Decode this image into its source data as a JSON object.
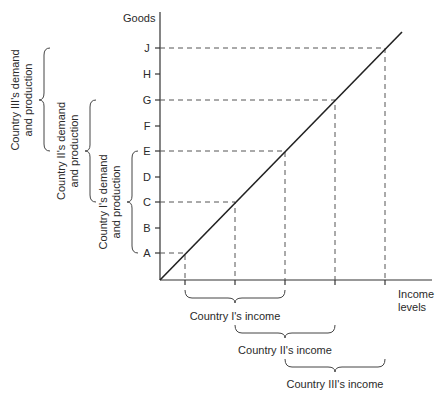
{
  "axes": {
    "y_label": "Goods",
    "x_label_line1": "Income",
    "x_label_line2": "levels"
  },
  "y_ticks": [
    "A",
    "B",
    "C",
    "D",
    "E",
    "F",
    "G",
    "H",
    "J"
  ],
  "brackets_left": {
    "country1": {
      "line1": "Country I's demand",
      "line2": "and production"
    },
    "country2": {
      "line1": "Country II's demand",
      "line2": "and production"
    },
    "country3": {
      "line1": "Country III's demand",
      "line2": "and production"
    }
  },
  "brackets_bottom": {
    "country1": "Country I's income",
    "country2": "Country II's income",
    "country3": "Country III's income"
  },
  "colors": {
    "line": "#222222",
    "dash": "#555555",
    "text": "#2a2a2a"
  }
}
